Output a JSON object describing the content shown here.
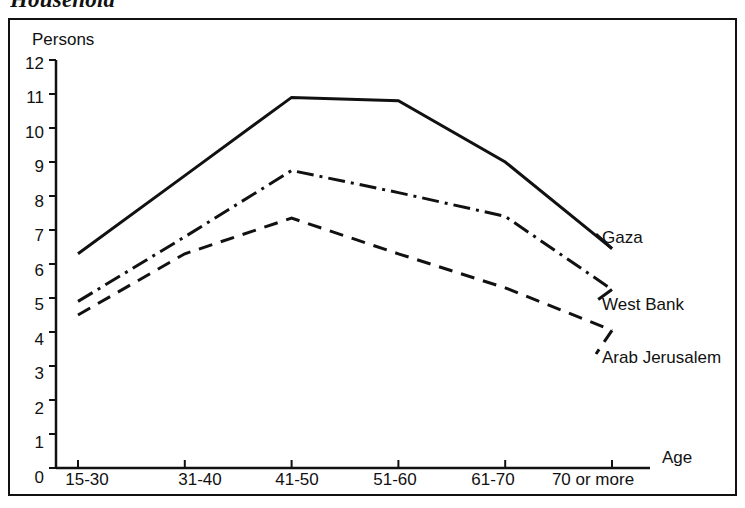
{
  "figure": {
    "title": "Household",
    "title_clipped": true
  },
  "chart_data": {
    "type": "line",
    "title": "Household",
    "xlabel": "Age",
    "ylabel": "Persons",
    "categories": [
      "15-30",
      "31-40",
      "41-50",
      "51-60",
      "61-70",
      "70 or more"
    ],
    "ylim": [
      0,
      12
    ],
    "yticks": [
      0,
      1,
      2,
      3,
      4,
      5,
      6,
      7,
      8,
      9,
      10,
      11,
      12
    ],
    "grid": false,
    "legend_position": "right-inline-labels",
    "series": [
      {
        "name": "Gaza",
        "line_style": "solid",
        "color": "#111111",
        "values": [
          6.3,
          8.6,
          10.9,
          10.8,
          9.0,
          6.45
        ]
      },
      {
        "name": "West Bank",
        "line_style": "dash-dot",
        "color": "#111111",
        "values": [
          4.9,
          6.8,
          8.75,
          8.1,
          7.4,
          5.25
        ]
      },
      {
        "name": "Arab Jerusalem",
        "line_style": "dashed",
        "color": "#111111",
        "values": [
          4.5,
          6.3,
          7.35,
          6.3,
          5.3,
          4.05
        ]
      }
    ]
  },
  "axes": {
    "y_title": "Persons",
    "x_title": "Age",
    "y_tick_labels": [
      "12",
      "11",
      "10",
      "9",
      "8",
      "7",
      "6",
      "5",
      "4",
      "3",
      "2",
      "1",
      "0"
    ],
    "x_tick_labels": [
      "15-30",
      "31-40",
      "41-50",
      "51-60",
      "61-70",
      "70 or more"
    ]
  },
  "series_labels": {
    "gaza": "Gaza",
    "west_bank": "West Bank",
    "arab_jerusalem": "Arab Jerusalem"
  }
}
